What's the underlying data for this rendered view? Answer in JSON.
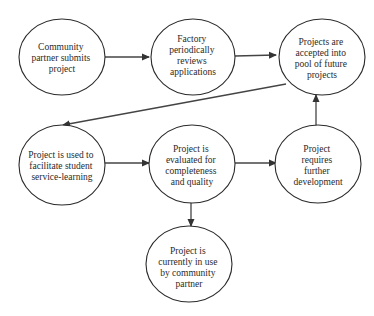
{
  "diagram": {
    "type": "flowchart",
    "nodes": [
      {
        "id": "n1",
        "lines": [
          "Community",
          "partner submits",
          "project"
        ]
      },
      {
        "id": "n2",
        "lines": [
          "Factory",
          "periodically",
          "reviews",
          "applications"
        ]
      },
      {
        "id": "n3",
        "lines": [
          "Projects are",
          "accepted into",
          "pool of future",
          "projects"
        ]
      },
      {
        "id": "n4",
        "lines": [
          "Project is used to",
          "facilitate student",
          "service-learning"
        ]
      },
      {
        "id": "n5",
        "lines": [
          "Project is",
          "evaluated for",
          "completeness",
          "and quality"
        ]
      },
      {
        "id": "n6",
        "lines": [
          "Project",
          "requires",
          "further",
          "development"
        ]
      },
      {
        "id": "n7",
        "lines": [
          "Project is",
          "currently in use",
          "by community",
          "partner"
        ]
      }
    ],
    "edges": [
      {
        "from": "n1",
        "to": "n2"
      },
      {
        "from": "n2",
        "to": "n3"
      },
      {
        "from": "n3",
        "to": "n4"
      },
      {
        "from": "n4",
        "to": "n5"
      },
      {
        "from": "n5",
        "to": "n6"
      },
      {
        "from": "n6",
        "to": "n3"
      },
      {
        "from": "n5",
        "to": "n7"
      }
    ],
    "colors": {
      "stroke": "#2a2a2a",
      "background": "#ffffff"
    }
  }
}
